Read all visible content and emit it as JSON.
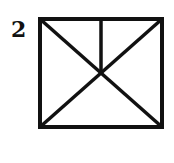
{
  "figure": {
    "label": "2",
    "shape": "square with both diagonals and a vertical line from top midpoint to center",
    "stroke_color": "#111111",
    "fill_color": "#ffffff"
  }
}
